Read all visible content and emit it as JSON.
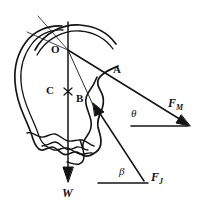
{
  "figure": {
    "type": "free-body-diagram",
    "ink_color": "#141414",
    "background_color": "#ffffff"
  },
  "points": [
    {
      "id": "O",
      "label": "O",
      "x": 58,
      "y": 50,
      "role": "atlanto-occipital joint / line convergence point"
    },
    {
      "id": "C",
      "label": "C",
      "x": 52,
      "y": 91,
      "role": "center of gravity marker"
    },
    {
      "id": "A",
      "label": "A",
      "x": 117,
      "y": 70,
      "role": "muscle force application point"
    },
    {
      "id": "B",
      "label": "B",
      "x": 80,
      "y": 99,
      "role": "joint force application point"
    }
  ],
  "forces": [
    {
      "id": "FM",
      "symbol": "F",
      "subscript": "M",
      "label": "F_M",
      "description": "muscle force vector directed down-right from A",
      "label_x": 172,
      "label_y": 104,
      "tail_x": 115,
      "tail_y": 74,
      "tip_x": 189,
      "tip_y": 126
    },
    {
      "id": "FJ",
      "symbol": "F",
      "subscript": "J",
      "label": "F_J",
      "description": "joint reaction force vector directed up-left toward B",
      "label_x": 155,
      "label_y": 178,
      "tail_x": 143,
      "tail_y": 182,
      "tip_x": 94,
      "tip_y": 106
    },
    {
      "id": "W",
      "symbol": "W",
      "subscript": "",
      "label": "W",
      "description": "weight vector directed vertically downward from C",
      "label_x": 65,
      "label_y": 193,
      "tail_x": 68,
      "tail_y": 46,
      "tip_x": 68,
      "tip_y": 180
    }
  ],
  "angles": [
    {
      "id": "theta",
      "symbol": "θ",
      "label_x": 134,
      "label_y": 114,
      "between": "F_M and horizontal reference line",
      "baseline_x1": 131,
      "baseline_x2": 189,
      "baseline_y": 126
    },
    {
      "id": "beta",
      "symbol": "β",
      "label_x": 122,
      "label_y": 172,
      "between": "F_J and horizontal reference line",
      "baseline_x1": 98,
      "baseline_x2": 150,
      "baseline_y": 183
    }
  ]
}
